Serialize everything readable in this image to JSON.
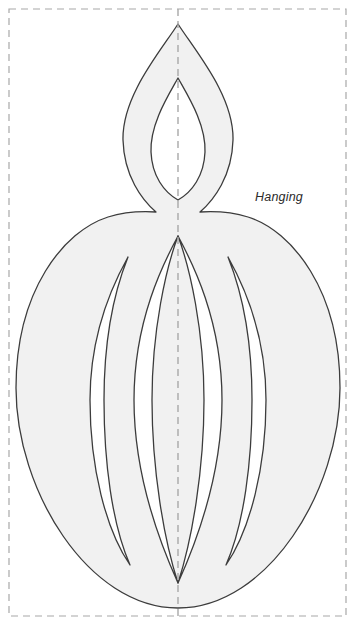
{
  "page": {
    "width": 354,
    "height": 624,
    "background_color": "#ffffff",
    "document_type": "papercraft-cut-template"
  },
  "annotations": {
    "label": "Hanging",
    "label_x": 255,
    "label_y": 201,
    "label_style": "italic",
    "label_color": "#2b2b2b"
  },
  "guides": {
    "cut_border": {
      "name": "cut-border",
      "style": "dashed",
      "color": "#a8a8a8",
      "stroke_width": 1.2,
      "dash_pattern": "7 5",
      "x": 9,
      "y": 9,
      "width": 337,
      "height": 607
    },
    "fold_line": {
      "name": "vertical-fold-line",
      "style": "dashed",
      "color": "#a8a8a8",
      "stroke_width": 1.4,
      "dash_pattern": "7 5",
      "x": 178,
      "y_start": 9,
      "y_end": 616,
      "orientation": "vertical"
    }
  },
  "shape": {
    "name": "hanging-lantern-silhouette",
    "fill_color": "#f1f1f1",
    "stroke_color": "#3c3c3c",
    "stroke_width": 1.3,
    "outline_path": "M178,24 C196,52 234,96 233,140 C232,176 214,200 200,212 C216,211 232,212 248,217 C292,231 340,290 340,388 C340,490 268,608 178,608 C88,608 16,490 16,388 C16,290 64,231 108,217 C124,212 140,211 156,212 C142,200 124,176 123,140 C122,96 160,52 178,24 Z",
    "inner_flame_path": "M178,78 C188,96 206,124 205,152 C204,176 192,192 178,200 C164,192 152,176 151,152 C150,124 168,96 178,78 Z",
    "slits": [
      {
        "name": "slit-center-left",
        "path": "M178,236 C166,268 152,330 152,400 C152,470 164,540 178,583 C164,552 134,480 134,400 C134,320 164,262 178,236 Z"
      },
      {
        "name": "slit-center-right",
        "path": "M178,236 C190,268 204,330 204,400 C204,470 192,540 178,583 C192,552 222,480 222,400 C222,320 192,262 178,236 Z"
      },
      {
        "name": "slit-outer-left",
        "path": "M128,257 C104,300 90,348 90,400 C90,468 106,530 130,565 C112,524 104,462 104,400 C104,340 114,292 128,257 Z"
      },
      {
        "name": "slit-outer-right",
        "path": "M228,257 C252,300 266,348 266,400 C266,468 250,530 226,565 C244,524 252,462 252,400 C252,340 242,292 228,257 Z"
      }
    ]
  },
  "geometry": {
    "center_x": 178,
    "flame_tip_y": 24,
    "flame_widest_left_x": 123,
    "flame_widest_right_x": 233,
    "neck_y": 215,
    "body_top_y": 212,
    "body_bottom_y": 608,
    "body_left_x": 16,
    "body_right_x": 340,
    "body_widest_y": 400
  }
}
